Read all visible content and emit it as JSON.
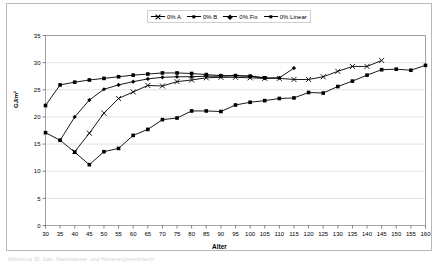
{
  "figure": {
    "caption": "Abbildung 35: Gas- Warmwasser- und Heizenergieverbrauch"
  },
  "chart_data": {
    "type": "line",
    "title": "",
    "xlabel": "Alter",
    "ylabel": "GJ/m²",
    "xlim": [
      30,
      160
    ],
    "ylim": [
      0,
      35
    ],
    "xticks": [
      30,
      35,
      40,
      45,
      50,
      55,
      60,
      65,
      70,
      75,
      80,
      85,
      90,
      95,
      100,
      105,
      110,
      115,
      120,
      125,
      130,
      135,
      140,
      145,
      150,
      155,
      160
    ],
    "yticks": [
      0,
      5,
      10,
      15,
      20,
      25,
      30,
      35
    ],
    "grid": "horizontal",
    "legend_position": "top-center",
    "series": [
      {
        "name": "0% A",
        "marker": "x",
        "color": "#000000",
        "points": [
          [
            40,
            13.6
          ],
          [
            45,
            17.0
          ],
          [
            50,
            20.7
          ],
          [
            55,
            23.4
          ],
          [
            60,
            24.6
          ],
          [
            65,
            25.8
          ],
          [
            70,
            25.7
          ],
          [
            75,
            26.5
          ],
          [
            80,
            26.8
          ],
          [
            85,
            27.2
          ],
          [
            90,
            27.3
          ],
          [
            95,
            27.3
          ],
          [
            100,
            27.2
          ],
          [
            105,
            27.1
          ],
          [
            110,
            27.1
          ],
          [
            115,
            26.9
          ],
          [
            120,
            26.9
          ],
          [
            125,
            27.4
          ],
          [
            130,
            28.4
          ],
          [
            135,
            29.3
          ],
          [
            140,
            29.3
          ],
          [
            145,
            30.4
          ]
        ]
      },
      {
        "name": "0% B",
        "marker": "square",
        "color": "#000000",
        "points": [
          [
            30,
            22.1
          ],
          [
            35,
            25.9
          ],
          [
            40,
            26.4
          ],
          [
            45,
            26.8
          ],
          [
            50,
            27.1
          ],
          [
            55,
            27.4
          ],
          [
            60,
            27.7
          ],
          [
            65,
            27.9
          ],
          [
            70,
            28.1
          ],
          [
            75,
            28.1
          ],
          [
            80,
            28.0
          ],
          [
            85,
            27.8
          ],
          [
            90,
            27.6
          ],
          [
            95,
            27.6
          ],
          [
            100,
            27.5
          ],
          [
            105,
            27.2
          ]
        ]
      },
      {
        "name": "0% Fix",
        "marker": "diamond",
        "color": "#000000",
        "points": [
          [
            35,
            15.7
          ],
          [
            40,
            20.0
          ],
          [
            45,
            23.1
          ],
          [
            50,
            25.1
          ],
          [
            55,
            25.9
          ],
          [
            60,
            26.5
          ],
          [
            65,
            27.0
          ],
          [
            70,
            27.3
          ],
          [
            75,
            27.4
          ],
          [
            80,
            27.4
          ],
          [
            85,
            27.5
          ],
          [
            90,
            27.5
          ],
          [
            95,
            27.6
          ],
          [
            100,
            27.5
          ],
          [
            105,
            27.2
          ],
          [
            110,
            27.2
          ],
          [
            115,
            29.0
          ]
        ]
      },
      {
        "name": "0% Linear",
        "marker": "square",
        "color": "#000000",
        "points": [
          [
            30,
            17.1
          ],
          [
            35,
            15.7
          ],
          [
            40,
            13.5
          ],
          [
            45,
            11.2
          ],
          [
            50,
            13.6
          ],
          [
            55,
            14.2
          ],
          [
            60,
            16.6
          ],
          [
            65,
            17.7
          ],
          [
            70,
            19.5
          ],
          [
            75,
            19.8
          ],
          [
            80,
            21.1
          ],
          [
            85,
            21.1
          ],
          [
            90,
            21.0
          ],
          [
            95,
            22.2
          ],
          [
            100,
            22.7
          ],
          [
            105,
            23.0
          ],
          [
            110,
            23.4
          ],
          [
            115,
            23.5
          ],
          [
            120,
            24.5
          ],
          [
            125,
            24.4
          ],
          [
            130,
            25.6
          ],
          [
            135,
            26.6
          ],
          [
            140,
            27.7
          ],
          [
            145,
            28.7
          ],
          [
            150,
            28.8
          ],
          [
            155,
            28.6
          ],
          [
            160,
            29.5
          ]
        ]
      }
    ]
  },
  "legend": {
    "items": [
      {
        "label": "0% A",
        "marker": "x-marker-icon"
      },
      {
        "label": "0% B",
        "marker": "square-marker-icon"
      },
      {
        "label": "0% Fix",
        "marker": "diamond-marker-icon"
      },
      {
        "label": "0% Linear",
        "marker": "square-marker-icon"
      }
    ]
  }
}
